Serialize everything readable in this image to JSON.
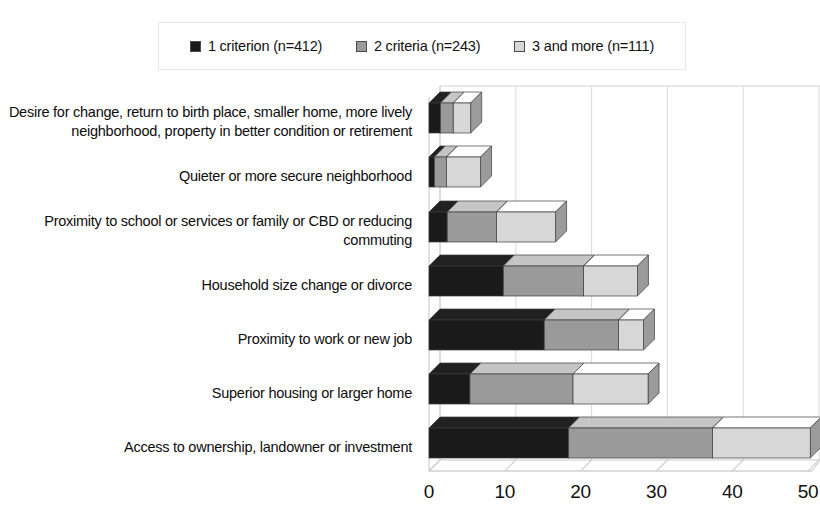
{
  "legend": {
    "entries": [
      {
        "label": "1 criterion (n=412)",
        "color": "#1a1a1a",
        "series_key": "1_criterion"
      },
      {
        "label": "2 criteria (n=243)",
        "color": "#9a9a9a",
        "series_key": "2_criteria"
      },
      {
        "label": "3 and more (n=111)",
        "color": "#d7d7d7",
        "series_key": "3_and_more"
      }
    ]
  },
  "axis": {
    "ticks": [
      "0",
      "10",
      "20",
      "30",
      "40",
      "50"
    ],
    "tick_values": [
      0,
      10,
      20,
      30,
      40,
      50
    ],
    "min": 0,
    "max": 50
  },
  "chart_data": {
    "type": "bar",
    "orientation": "horizontal",
    "stacked": true,
    "style": "3d",
    "title": "",
    "xlabel": "",
    "ylabel": "",
    "xlim": [
      0,
      50
    ],
    "grid": true,
    "legend_position": "top",
    "categories": [
      "Desire for change, return to birth place, smaller home, more lively neighborhood,  property in better condition or retirement",
      "Quieter or more secure neighborhood",
      "Proximity to school or services or family or CBD or reducing commuting",
      "Household size change or divorce",
      "Proximity to work or new job",
      "Superior housing or larger home",
      "Access to ownership, landowner or investment"
    ],
    "series": [
      {
        "name": "1 criterion (n=412)",
        "color": "#1a1a1a",
        "values": [
          1.5,
          0.7,
          2.4,
          9.8,
          15.2,
          5.4,
          18.4
        ]
      },
      {
        "name": "2 criteria (n=243)",
        "color": "#9a9a9a",
        "values": [
          1.7,
          1.6,
          6.5,
          10.6,
          9.8,
          13.6,
          19.0
        ]
      },
      {
        "name": "3 and more (n=111)",
        "color": "#d7d7d7",
        "values": [
          2.3,
          4.5,
          7.8,
          7.1,
          3.3,
          9.9,
          12.9
        ]
      }
    ],
    "totals": [
      5.5,
      6.8,
      16.7,
      27.5,
      28.3,
      28.9,
      50.3
    ]
  }
}
